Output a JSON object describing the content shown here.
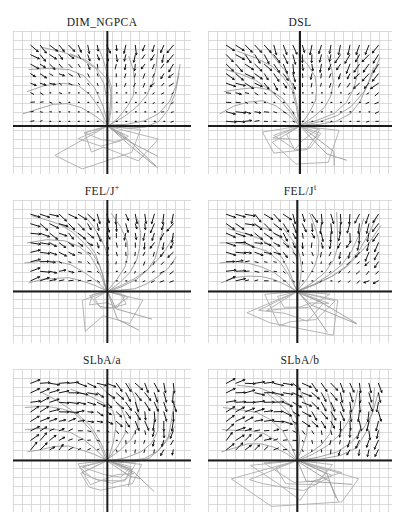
{
  "chart_data": {
    "type": "quiver",
    "title": "",
    "grid": "on",
    "axes": {
      "tick_labels": "none",
      "style": "crosshair through plot"
    },
    "content_note": "Six panels comparing learned inverse-kinematics vector fields: each panel shows a fine background grid, heavy horizontal and vertical axis lines, short black direction arrows sampled on a lattice above the horizontal axis, gray trajectories converging to the axes crossing, and gray polygon outlines (arm poses) below the axis.",
    "layout": {
      "rows": 3,
      "cols": 2,
      "panel_height": 143,
      "grid_step": 9,
      "arrow_step": 9.5,
      "field_region": {
        "x0": 0.1,
        "x1": 0.93,
        "y0": 0.1
      },
      "columns": [
        {
          "x": 13,
          "w": 178
        },
        {
          "x": 208,
          "w": 184
        }
      ],
      "row_tops": [
        11,
        180,
        349
      ],
      "title_height": 20
    },
    "style": {
      "background": "#ffffff",
      "grid_color": "#cccccc",
      "axis_color": "#1c1c1c",
      "arrow_color": "#161616",
      "trajectory_color": "#9b9b9b",
      "polygon_color": "#adadad",
      "title_color": "#1a1a1a"
    },
    "panels": [
      {
        "id": "dim-ngpca",
        "title": {
          "base": "DIM_NGPCA",
          "sup": ""
        },
        "seed": 7,
        "axis_x_frac": 0.53,
        "axis_y_frac": 0.665,
        "field": {
          "base": 0.7,
          "edge": 3.0,
          "power": 2.2,
          "swirl": -10,
          "noise_angle": 34,
          "boost": {
            "tl": 1.4,
            "tr": 1.6,
            "bl": 0.9,
            "br": 0.9
          },
          "bottom_band": 1.2,
          "left_band": 1.0
        },
        "trajectories": {
          "count": 10,
          "bulge": 0.24,
          "dir": 1,
          "below_axis": 3
        },
        "polygons": {
          "count": 4,
          "max_r": 55
        }
      },
      {
        "id": "dsl",
        "title": {
          "base": "DSL",
          "sup": ""
        },
        "seed": 13,
        "axis_x_frac": 0.5,
        "axis_y_frac": 0.665,
        "field": {
          "base": 0.7,
          "edge": 4.8,
          "power": 2.4,
          "swirl": -8,
          "noise_angle": 26,
          "boost": {
            "tl": 2.6,
            "tr": 1.4,
            "bl": 1.1,
            "br": 0.7
          },
          "bottom_band": 2.6,
          "left_band": 1.1
        },
        "trajectories": {
          "count": 10,
          "bulge": 0.22,
          "dir": 1,
          "below_axis": 2
        },
        "polygons": {
          "count": 5,
          "max_r": 58
        }
      },
      {
        "id": "fel-j-plus",
        "title": {
          "base": "FEL/J",
          "sup": "+"
        },
        "seed": 29,
        "axis_x_frac": 0.53,
        "axis_y_frac": 0.64,
        "field": {
          "base": 0.9,
          "edge": 4.2,
          "power": 1.8,
          "swirl": -22,
          "noise_angle": 38,
          "boost": {
            "tl": 1.7,
            "tr": 1.4,
            "bl": 1.2,
            "br": 1.1
          },
          "bottom_band": 1.7,
          "left_band": 1.8
        },
        "trajectories": {
          "count": 11,
          "bulge": 0.2,
          "dir": 1,
          "below_axis": 2
        },
        "polygons": {
          "count": 4,
          "max_r": 55
        }
      },
      {
        "id": "fel-j-t",
        "title": {
          "base": "FEL/J",
          "sup": "t"
        },
        "seed": 41,
        "axis_x_frac": 0.485,
        "axis_y_frac": 0.64,
        "field": {
          "base": 0.9,
          "edge": 4.6,
          "power": 1.8,
          "swirl": -28,
          "noise_angle": 38,
          "boost": {
            "tl": 1.9,
            "tr": 1.5,
            "bl": 1.1,
            "br": 1.0
          },
          "bottom_band": 1.6,
          "left_band": 2.2
        },
        "trajectories": {
          "count": 11,
          "bulge": 0.2,
          "dir": 1,
          "below_axis": 3
        },
        "polygons": {
          "count": 5,
          "max_r": 60
        }
      },
      {
        "id": "slba-a",
        "title": {
          "base": "SLbA/a",
          "sup": ""
        },
        "seed": 57,
        "axis_x_frac": 0.53,
        "axis_y_frac": 0.64,
        "field": {
          "base": 1.0,
          "edge": 6.0,
          "power": 1.6,
          "swirl": -55,
          "noise_angle": 30,
          "boost": {
            "tl": 1.5,
            "tr": 2.0,
            "bl": 1.1,
            "br": 1.2
          },
          "bottom_band": 1.4,
          "left_band": 1.6
        },
        "trajectories": {
          "count": 10,
          "bulge": 0.26,
          "dir": 1,
          "below_axis": 3
        },
        "polygons": {
          "count": 5,
          "max_r": 58
        }
      },
      {
        "id": "slba-b",
        "title": {
          "base": "SLbA/b",
          "sup": ""
        },
        "seed": 73,
        "axis_x_frac": 0.485,
        "axis_y_frac": 0.64,
        "field": {
          "base": 1.1,
          "edge": 6.5,
          "power": 1.5,
          "swirl": -60,
          "noise_angle": 32,
          "boost": {
            "tl": 1.9,
            "tr": 2.1,
            "bl": 1.2,
            "br": 1.3
          },
          "bottom_band": 1.5,
          "left_band": 2.4
        },
        "trajectories": {
          "count": 10,
          "bulge": 0.26,
          "dir": 1,
          "below_axis": 3
        },
        "polygons": {
          "count": 5,
          "max_r": 60
        }
      }
    ]
  }
}
